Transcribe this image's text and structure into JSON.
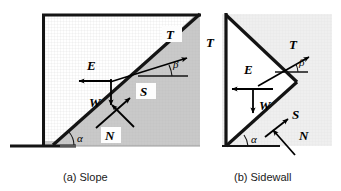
{
  "figure": {
    "background_color": "#ffffff",
    "panels": [
      {
        "id": "panel-a",
        "caption": "(a) Slope",
        "geometry_type": "inclined plane with soil wedge",
        "fill_shaded": "#c9c9c9",
        "fill_unshaded": "#f2f2f2",
        "outline_color": "#141414",
        "forces": [
          {
            "symbol": "T",
            "name": "tension-force",
            "direction": "up-right along slope",
            "boxed": true
          },
          {
            "symbol": "E",
            "name": "earth-pressure-force",
            "direction": "horizontal left",
            "boxed": false
          },
          {
            "symbol": "W",
            "name": "weight-force",
            "direction": "vertically downward",
            "boxed": false
          },
          {
            "symbol": "S",
            "name": "shear-force",
            "direction": "up-right along failure plane",
            "boxed": true
          },
          {
            "symbol": "N",
            "name": "normal-force",
            "direction": "up-left normal to plane",
            "boxed": true
          }
        ],
        "angles": [
          {
            "symbol": "α",
            "name": "slope-angle",
            "location": "bottom-left, between base and failure plane"
          },
          {
            "symbol": "β",
            "name": "tension-angle",
            "location": "mid-right, between horizontal and tension"
          }
        ],
        "outer_label": {
          "symbol": "T",
          "name": "tension-force-outer"
        }
      },
      {
        "id": "panel-b",
        "caption": "(b) Sidewall",
        "geometry_type": "vertical sidewall with triangular wedge",
        "fill_shaded": "#eeeeee",
        "fill_unshaded": "#ffffff",
        "outline_color": "#141414",
        "forces": [
          {
            "symbol": "T",
            "name": "tension-force",
            "direction": "up-right",
            "boxed": false
          },
          {
            "symbol": "E",
            "name": "earth-pressure-force",
            "direction": "horizontal left",
            "boxed": false
          },
          {
            "symbol": "W",
            "name": "weight-force",
            "direction": "vertically downward",
            "boxed": false
          },
          {
            "symbol": "S",
            "name": "shear-force",
            "direction": "up-right along lower face",
            "boxed": false
          },
          {
            "symbol": "N",
            "name": "normal-force",
            "direction": "up-left normal to face",
            "boxed": false
          }
        ],
        "angles": [
          {
            "symbol": "α",
            "name": "wedge-angle",
            "location": "bottom, between base and lower wedge face"
          },
          {
            "symbol": "β",
            "name": "tension-angle",
            "location": "right, between horizontal and tension"
          }
        ]
      }
    ]
  }
}
